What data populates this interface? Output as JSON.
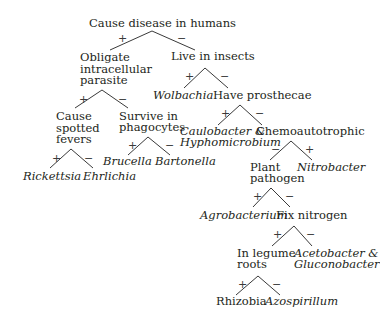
{
  "diagram": {
    "type": "binary dichotomous key",
    "nodes": {
      "root": "Cause disease in humans",
      "obligate_1": "Obligate",
      "obligate_2": "intracellular",
      "obligate_3": "parasite",
      "live_insects": "Live in insects",
      "spotted_1": "Cause",
      "spotted_2": "spotted",
      "spotted_3": "fevers",
      "survive_1": "Survive in",
      "survive_2": "phagocytes",
      "prosthecae": "Have prosthecae",
      "chemo": "Chemoautotrophic",
      "plant_1": "Plant",
      "plant_2": "pathogen",
      "fix_n": "Fix nitrogen",
      "legume_1": "In legume",
      "legume_2": "roots"
    },
    "taxa": {
      "rickettsia": "Rickettsia",
      "ehrlichia": "Ehrlichia",
      "brucella": "Brucella",
      "bartonella": "Bartonella",
      "wolbachia": "Wolbachia",
      "caulo_1": "Caulobacter &",
      "caulo_2": "Hyphomicrobium",
      "nitrobacter": "Nitrobacter",
      "agrobacterium": "Agrobacterium",
      "aceto_1": "Acetobacter &",
      "aceto_2": "Gluconobacter",
      "rhizobia": "Rhizobia",
      "azospirillum": "Azospirillum"
    },
    "signs": {
      "plus": "+",
      "minus": "−"
    },
    "edges": [
      {
        "from": "Cause disease in humans",
        "yes": "Obligate intracellular parasite",
        "no": "Live in insects"
      },
      {
        "from": "Obligate intracellular parasite",
        "yes": "Cause spotted fevers",
        "no": "Survive in phagocytes"
      },
      {
        "from": "Cause spotted fevers",
        "yes": "Rickettsia",
        "no": "Ehrlichia"
      },
      {
        "from": "Survive in phagocytes",
        "yes": "Brucella",
        "no": "Bartonella"
      },
      {
        "from": "Live in insects",
        "yes": "Wolbachia",
        "no": "Have prosthecae"
      },
      {
        "from": "Have prosthecae",
        "yes": "Caulobacter & Hyphomicrobium",
        "no": "Chemoautotrophic"
      },
      {
        "from": "Chemoautotrophic",
        "no": "Plant pathogen",
        "yes": "Nitrobacter"
      },
      {
        "from": "Plant pathogen",
        "yes": "Agrobacterium",
        "no": "Fix nitrogen"
      },
      {
        "from": "Fix nitrogen",
        "yes": "In legume roots",
        "no": "Acetobacter & Gluconobacter"
      },
      {
        "from": "In legume roots",
        "yes": "Rhizobia",
        "no": "Azospirillum"
      }
    ],
    "colors": {
      "background": "#ffffff",
      "text": "#231f20",
      "lines": "#3a3a3a"
    }
  }
}
